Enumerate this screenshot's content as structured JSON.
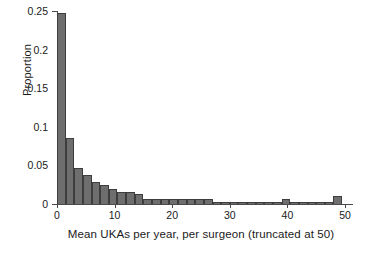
{
  "chart_data": {
    "type": "bar",
    "title": "",
    "subtitle": "",
    "xlabel": "Mean UKAs per year, per surgeon (truncated at 50)",
    "ylabel": "Proportion",
    "xlim": [
      0,
      50
    ],
    "ylim": [
      0,
      0.25
    ],
    "grid": false,
    "legend": null,
    "bin_width": 1.5,
    "bar_color": "#6e6e6e",
    "edge_color": "#3d3d3d",
    "axis_color": "#4a4a4a",
    "xticks": [
      0,
      10,
      20,
      30,
      40,
      50
    ],
    "xtick_labels": [
      "0",
      "10",
      "20",
      "30",
      "40",
      "50"
    ],
    "yticks": [
      0,
      0.05,
      0.1,
      0.15,
      0.2,
      0.25
    ],
    "ytick_labels": [
      "0",
      "0.05",
      "0.1",
      "0.15",
      "0.2",
      "0.25"
    ],
    "bin_starts": [
      0,
      1.5,
      3,
      4.5,
      6,
      7.5,
      9,
      10.5,
      12,
      13.5,
      15,
      16.5,
      18,
      19.5,
      21,
      22.5,
      24,
      25.5,
      27,
      28.5,
      30,
      31.5,
      33,
      34.5,
      36,
      37.5,
      39,
      40.5,
      42,
      43.5,
      45,
      46.5,
      48,
      49.5
    ],
    "values": [
      0.247,
      0.085,
      0.047,
      0.038,
      0.029,
      0.024,
      0.019,
      0.016,
      0.016,
      0.013,
      0.007,
      0.007,
      0.006,
      0.007,
      0.007,
      0.007,
      0.007,
      0.006,
      0.003,
      0.003,
      0.003,
      0.003,
      0.003,
      0.002,
      0.003,
      0.003,
      0.006,
      0.002,
      0.002,
      0.002,
      0.002,
      0.002,
      0.01,
      0.0
    ]
  }
}
